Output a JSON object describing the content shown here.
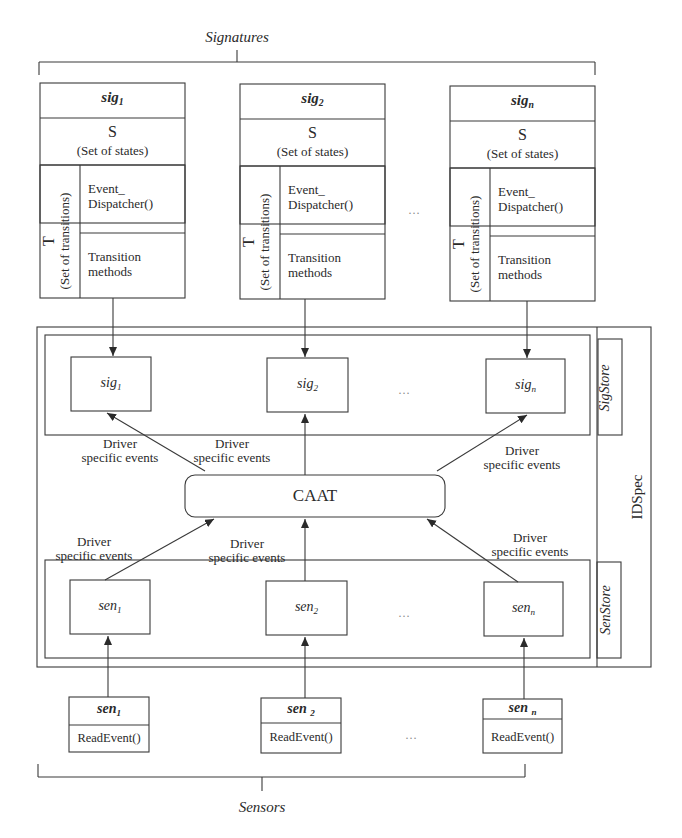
{
  "top_group": {
    "label": "Signatures"
  },
  "signature_classes": [
    {
      "name": "sig",
      "subscript": "1",
      "states_title": "S",
      "states_caption": "(Set of states)",
      "transitions_title": "T",
      "transitions_caption": "(Set of transitions)",
      "dispatcher": [
        "Event_",
        "Dispatcher()"
      ],
      "methods": [
        "Transition",
        "methods"
      ]
    },
    {
      "name": "sig",
      "subscript": "2",
      "states_title": "S",
      "states_caption": "(Set of states)",
      "transitions_title": "T",
      "transitions_caption": "(Set of transitions)",
      "dispatcher": [
        "Event_",
        "Dispatcher()"
      ],
      "methods": [
        "Transition",
        "methods"
      ]
    },
    {
      "name": "sig",
      "subscript": "n",
      "states_title": "S",
      "states_caption": "(Set of states)",
      "transitions_title": "T",
      "transitions_caption": "(Set of transitions)",
      "dispatcher": [
        "Event_",
        "Dispatcher()"
      ],
      "methods": [
        "Transition",
        "methods"
      ]
    }
  ],
  "ellipsis": "…",
  "idspec": {
    "label": "IDSpec",
    "sigstore": {
      "label": "SigStore",
      "items": [
        {
          "name": "sig",
          "subscript": "1"
        },
        {
          "name": "sig",
          "subscript": "2"
        },
        {
          "name": "sig",
          "subscript": "n"
        }
      ]
    },
    "caat": {
      "label": "CAAT"
    },
    "senstore": {
      "label": "SenStore",
      "items": [
        {
          "name": "sen",
          "subscript": "1"
        },
        {
          "name": "sen",
          "subscript": "2"
        },
        {
          "name": "sen",
          "subscript": "n"
        }
      ]
    },
    "edge_labels": {
      "line1": "Driver",
      "line2": "specific events"
    }
  },
  "sensor_classes": [
    {
      "name": "sen",
      "subscript": "1",
      "method": "ReadEvent()"
    },
    {
      "name": "sen",
      "subscript": "2",
      "method": "ReadEvent()"
    },
    {
      "name": "sen",
      "subscript": "n",
      "method": "ReadEvent()"
    }
  ],
  "bottom_group": {
    "label": "Sensors"
  }
}
